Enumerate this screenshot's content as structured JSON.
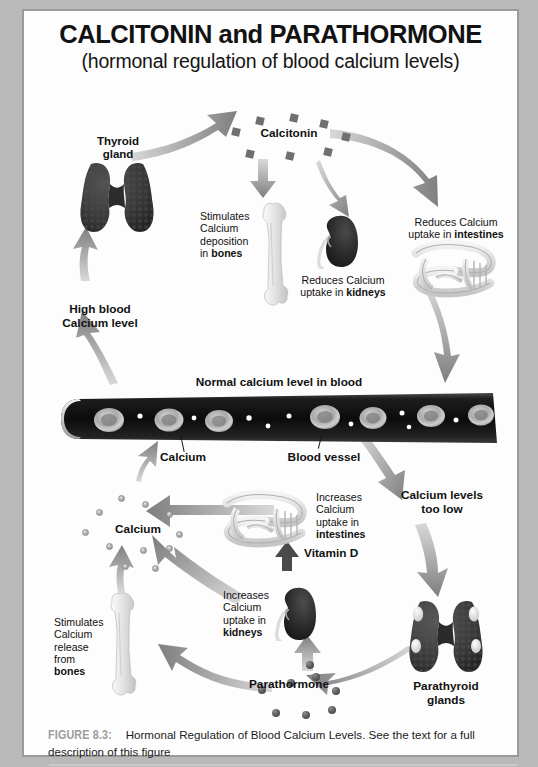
{
  "title": {
    "main": "CALCITONIN and PARATHORMONE",
    "sub": "(hormonal regulation of blood calcium levels)"
  },
  "caption": {
    "figure_number": "FIGURE 8.3:",
    "line1": " Hormonal Regulation of Blood Calcium Levels. See the text for a full",
    "line2": "description of this figure"
  },
  "diagram": {
    "upper_loop": {
      "thyroid_label": "Thyroid\ngland",
      "thyroid_label_line1": "Thyroid",
      "thyroid_label_line2": "gland",
      "calcitonin_label": "Calcitonin",
      "bones_effect_line1": "Stimulates",
      "bones_effect_line2": "Calcium",
      "bones_effect_line3": "deposition",
      "bones_effect_line4_pre": "in ",
      "bones_effect_line4_bold": "bones",
      "kidney_effect_line1": "Reduces Calcium",
      "kidney_effect_line2_pre": "uptake in ",
      "kidney_effect_line2_bold": "kidneys",
      "intestine_effect_line1": "Reduces Calcium",
      "intestine_effect_line2_pre": "uptake in ",
      "intestine_effect_line2_bold": "intestines",
      "high_blood_line1": "High blood",
      "high_blood_line2": "Calcium level"
    },
    "vessel": {
      "normal_level_label": "Normal calcium level in blood",
      "calcium_label": "Calcium",
      "vessel_label": "Blood vessel"
    },
    "lower_loop": {
      "too_low_line1": "Calcium levels",
      "too_low_line2": "too low",
      "parathyroid_line1": "Parathyroid",
      "parathyroid_line2": "glands",
      "parathormone_label": "Parathormone",
      "calcium_pool_label": "Calcium",
      "vitamin_d_label": "Vitamin D",
      "intestine_effect_line1": "Increases",
      "intestine_effect_line2": "Calcium",
      "intestine_effect_line3": "uptake in",
      "intestine_effect_line4_bold": "intestines",
      "kidney_effect_line1": "Increases",
      "kidney_effect_line2": "Calcium",
      "kidney_effect_line3": "uptake in",
      "kidney_effect_line4_bold": "kidneys",
      "bone_effect_line1": "Stimulates",
      "bone_effect_line2": "Calcium",
      "bone_effect_line3": "release",
      "bone_effect_line4": "from",
      "bone_effect_line5_bold": "bones"
    }
  },
  "colors": {
    "page_background": "#b9b9b9",
    "frame_background": "#fdfdfd",
    "frame_border": "#9a9a9a",
    "arrow_gray": "#8a8a8a",
    "gland_dark": "#3a3a3a",
    "bone_light": "#dcdcdc",
    "kidney_dark": "#2b2b2b",
    "vessel_dark": "#121212",
    "rbc_gray": "#b6b6b6",
    "figure_number_gray": "#9c9c9c",
    "text_black": "#111111"
  }
}
